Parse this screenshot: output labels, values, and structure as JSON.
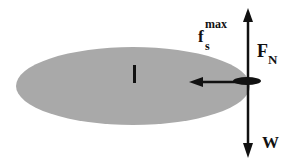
{
  "diagram": {
    "type": "free-body diagram",
    "object": {
      "shape": "ellipse",
      "fill": "#a9a9a9",
      "center_mark": "|"
    },
    "forces": [
      {
        "id": "normal",
        "label": "F",
        "subscript": "N",
        "direction": "up"
      },
      {
        "id": "weight",
        "label": "W",
        "direction": "down"
      },
      {
        "id": "friction",
        "label": "f",
        "subscript": "s",
        "superscript": "max",
        "direction": "left"
      }
    ],
    "colors": {
      "arrow": "#111111",
      "body": "#a9a9a9",
      "contact": "#111111"
    }
  }
}
